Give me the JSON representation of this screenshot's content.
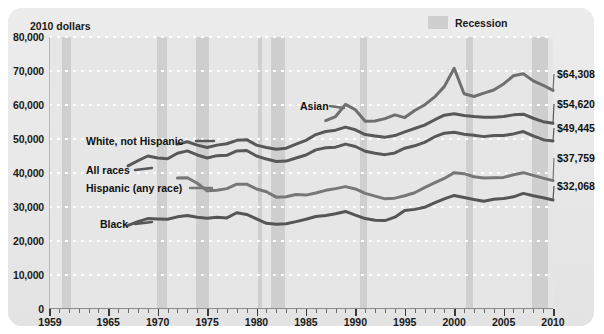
{
  "chart_data": {
    "type": "line",
    "title": "",
    "unit_label": "2010 dollars",
    "xlabel": "",
    "ylabel": "2010 dollars",
    "xlim": [
      1959,
      2010
    ],
    "ylim": [
      0,
      80000
    ],
    "ytick_labels": [
      "80,000",
      "70,000",
      "60,000",
      "50,000",
      "40,000",
      "30,000",
      "20,000",
      "10,000",
      "0"
    ],
    "ytick_values": [
      80000,
      70000,
      60000,
      50000,
      40000,
      30000,
      20000,
      10000,
      0
    ],
    "xtick_labels": [
      "1959",
      "1965",
      "1970",
      "1975",
      "1980",
      "1985",
      "1990",
      "1995",
      "2000",
      "2005",
      "2010"
    ],
    "xtick_values": [
      1959,
      1965,
      1970,
      1975,
      1980,
      1985,
      1990,
      1995,
      2000,
      2005,
      2010
    ],
    "grid": "horizontal-dotted-white",
    "legend": {
      "position": "top-right",
      "entries": [
        {
          "label": "Recession",
          "color": "#cfcfcf",
          "type": "band"
        }
      ]
    },
    "recessions": [
      {
        "start": 1960.3,
        "end": 1961.2
      },
      {
        "start": 1969.9,
        "end": 1970.9
      },
      {
        "start": 1973.9,
        "end": 1975.2
      },
      {
        "start": 1980.1,
        "end": 1980.6
      },
      {
        "start": 1981.5,
        "end": 1982.9
      },
      {
        "start": 1990.5,
        "end": 1991.2
      },
      {
        "start": 2001.2,
        "end": 2001.9
      },
      {
        "start": 2007.9,
        "end": 2009.5
      }
    ],
    "series": [
      {
        "name": "Asian",
        "label": "Asian",
        "color": "#6f6f6f",
        "end_value_label": "$64,308",
        "x": [
          1987,
          1988,
          1989,
          1990,
          1991,
          1992,
          1993,
          1994,
          1995,
          1996,
          1997,
          1998,
          1999,
          2000,
          2001,
          2002,
          2003,
          2004,
          2005,
          2006,
          2007,
          2008,
          2009,
          2010
        ],
        "values": [
          55400,
          56600,
          60200,
          58600,
          55200,
          55300,
          56000,
          57100,
          56300,
          58400,
          60000,
          62300,
          65400,
          70800,
          63300,
          62500,
          63500,
          64400,
          66200,
          68600,
          69200,
          67100,
          65800,
          64308
        ]
      },
      {
        "name": "White, not Hispanic",
        "label": "White, not Hispanic",
        "color": "#585858",
        "end_value_label": "$54,620",
        "x": [
          1972,
          1973,
          1974,
          1975,
          1976,
          1977,
          1978,
          1979,
          1980,
          1981,
          1982,
          1983,
          1984,
          1985,
          1986,
          1987,
          1988,
          1989,
          1990,
          1991,
          1992,
          1993,
          1994,
          1995,
          1996,
          1997,
          1998,
          1999,
          2000,
          2001,
          2002,
          2003,
          2004,
          2005,
          2006,
          2007,
          2008,
          2009,
          2010
        ],
        "values": [
          48500,
          49200,
          48200,
          47500,
          48200,
          48600,
          49600,
          49800,
          48200,
          47500,
          47000,
          47300,
          48500,
          49600,
          51300,
          52200,
          52600,
          53500,
          52700,
          51300,
          50900,
          50500,
          51000,
          52100,
          53100,
          54100,
          55600,
          57000,
          57400,
          56900,
          56600,
          56400,
          56400,
          56600,
          57100,
          57300,
          56100,
          55100,
          54620
        ]
      },
      {
        "name": "All races",
        "label": "All races",
        "color": "#585858",
        "end_value_label": "$49,445",
        "x": [
          1967,
          1968,
          1969,
          1970,
          1971,
          1972,
          1973,
          1974,
          1975,
          1976,
          1977,
          1978,
          1979,
          1980,
          1981,
          1982,
          1983,
          1984,
          1985,
          1986,
          1987,
          1988,
          1989,
          1990,
          1991,
          1992,
          1993,
          1994,
          1995,
          1996,
          1997,
          1998,
          1999,
          2000,
          2001,
          2002,
          2003,
          2004,
          2005,
          2006,
          2007,
          2008,
          2009,
          2010
        ],
        "values": [
          42100,
          43600,
          45000,
          44400,
          44200,
          45800,
          46500,
          45300,
          44400,
          45100,
          45200,
          46500,
          46600,
          45000,
          44100,
          43400,
          43500,
          44400,
          45300,
          46800,
          47400,
          47600,
          48500,
          47800,
          46400,
          45800,
          45400,
          45900,
          47300,
          48000,
          49000,
          50600,
          51700,
          52000,
          51400,
          51100,
          50700,
          51000,
          51000,
          51500,
          52200,
          50900,
          49800,
          49445
        ]
      },
      {
        "name": "Hispanic (any race)",
        "label": "Hispanic (any race)",
        "color": "#777777",
        "end_value_label": "$37,759",
        "x": [
          1972,
          1973,
          1974,
          1975,
          1976,
          1977,
          1978,
          1979,
          1980,
          1981,
          1982,
          1983,
          1984,
          1985,
          1986,
          1987,
          1988,
          1989,
          1990,
          1991,
          1992,
          1993,
          1994,
          1995,
          1996,
          1997,
          1998,
          1999,
          2000,
          2001,
          2002,
          2003,
          2004,
          2005,
          2006,
          2007,
          2008,
          2009,
          2010
        ],
        "values": [
          38500,
          38600,
          37000,
          34800,
          34900,
          35400,
          36700,
          36700,
          35300,
          34500,
          32900,
          33000,
          33700,
          33500,
          34100,
          34900,
          35400,
          36000,
          35300,
          34000,
          33200,
          32400,
          32600,
          33300,
          34200,
          35700,
          37100,
          38400,
          40100,
          39800,
          38900,
          38500,
          38600,
          38700,
          39500,
          40100,
          39300,
          38500,
          37759
        ]
      },
      {
        "name": "Black",
        "label": "Black",
        "color": "#555555",
        "end_value_label": "$32,068",
        "x": [
          1967,
          1968,
          1969,
          1970,
          1971,
          1972,
          1973,
          1974,
          1975,
          1976,
          1977,
          1978,
          1979,
          1980,
          1981,
          1982,
          1983,
          1984,
          1985,
          1986,
          1987,
          1988,
          1989,
          1990,
          1991,
          1992,
          1993,
          1994,
          1995,
          1996,
          1997,
          1998,
          1999,
          2000,
          2001,
          2002,
          2003,
          2004,
          2005,
          2006,
          2007,
          2008,
          2009,
          2010
        ],
        "values": [
          24600,
          25700,
          26600,
          26500,
          26400,
          27100,
          27500,
          27000,
          26700,
          27000,
          26800,
          28300,
          27800,
          26500,
          25200,
          24900,
          25100,
          25700,
          26400,
          27200,
          27500,
          28000,
          28700,
          27600,
          26600,
          26100,
          26000,
          27000,
          29000,
          29300,
          29900,
          31200,
          32400,
          33400,
          32800,
          32200,
          31700,
          32300,
          32500,
          33000,
          34000,
          33300,
          32700,
          32068
        ]
      }
    ],
    "series_label_positions": [
      {
        "name": "Asian",
        "left": 300,
        "top": 100
      },
      {
        "name": "White, not Hispanic",
        "left": 86,
        "top": 135
      },
      {
        "name": "All races",
        "left": 86,
        "top": 164
      },
      {
        "name": "Hispanic (any race)",
        "left": 86,
        "top": 182
      },
      {
        "name": "Black",
        "left": 100,
        "top": 218
      }
    ],
    "value_label_positions": [
      {
        "name": "Asian",
        "left": 557,
        "top": 68
      },
      {
        "name": "White, not Hispanic",
        "left": 557,
        "top": 98
      },
      {
        "name": "All races",
        "left": 557,
        "top": 122
      },
      {
        "name": "Hispanic (any race)",
        "left": 557,
        "top": 152
      },
      {
        "name": "Black",
        "left": 557,
        "top": 180
      }
    ]
  },
  "panel": {
    "background_color": "#e9e9e9",
    "grid_color": "#ffffff",
    "recession_color": "#cfcfcf"
  }
}
